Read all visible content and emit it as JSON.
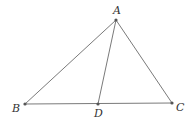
{
  "diagram": {
    "type": "triangle-with-cevian",
    "points": {
      "A": {
        "label": "A",
        "x": 116,
        "y": 20,
        "label_x": 113,
        "label_y": 14
      },
      "B": {
        "label": "B",
        "x": 25,
        "y": 104,
        "label_x": 12,
        "label_y": 112
      },
      "C": {
        "label": "C",
        "x": 172,
        "y": 103,
        "label_x": 176,
        "label_y": 111
      },
      "D": {
        "label": "D",
        "x": 98,
        "y": 104,
        "label_x": 94,
        "label_y": 117
      }
    },
    "segments": [
      {
        "from": "A",
        "to": "B"
      },
      {
        "from": "A",
        "to": "C"
      },
      {
        "from": "B",
        "to": "C"
      },
      {
        "from": "A",
        "to": "D"
      }
    ],
    "colors": {
      "line": "#7a7a7a",
      "point": "#555555",
      "label": "#333333"
    }
  }
}
